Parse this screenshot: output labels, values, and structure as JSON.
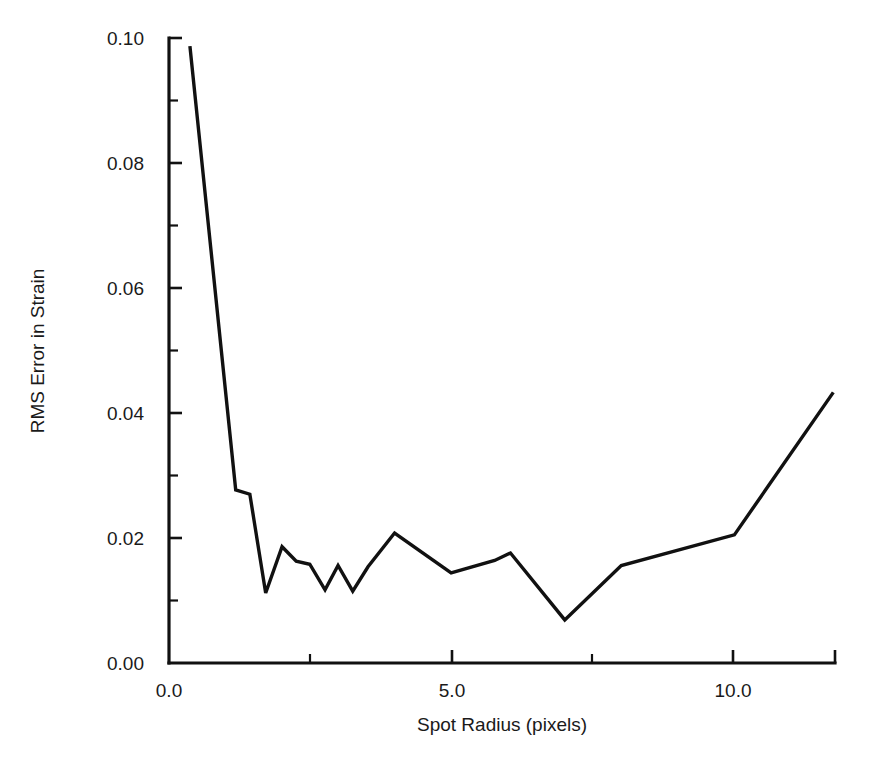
{
  "chart_data": {
    "type": "line",
    "title": "",
    "xlabel": "Spot Radius (pixels)",
    "ylabel": "RMS Error in Strain",
    "xlim": [
      0.0,
      11.78
    ],
    "ylim": [
      0.0,
      0.1
    ],
    "grid": false,
    "legend": null,
    "x_ticks": [
      0.0,
      2.5,
      5.0,
      7.5,
      10.0
    ],
    "x_tick_labels": [
      "0.0",
      "",
      "5.0",
      "",
      "10.0"
    ],
    "x_major_labeled": [
      "0.0",
      "5.0",
      "10.0"
    ],
    "y_ticks": [
      0.0,
      0.01,
      0.02,
      0.03,
      0.04,
      0.05,
      0.06,
      0.07,
      0.08,
      0.09,
      0.1
    ],
    "y_tick_labels": [
      "0.00",
      "",
      "0.02",
      "",
      "0.04",
      "",
      "0.06",
      "",
      "0.08",
      "",
      "0.10"
    ],
    "y_major_labeled": [
      "0.00",
      "0.02",
      "0.04",
      "0.06",
      "0.08",
      "0.10"
    ],
    "series": [
      {
        "name": "RMS Error in Strain",
        "color": "#111111",
        "x": [
          0.37,
          1.18,
          1.43,
          1.71,
          2.0,
          2.25,
          2.49,
          2.76,
          2.99,
          3.25,
          3.52,
          3.99,
          4.99,
          5.76,
          6.04,
          7.0,
          8.0,
          10.0,
          11.75
        ],
        "y": [
          0.0987,
          0.0277,
          0.027,
          0.0112,
          0.0186,
          0.0163,
          0.0158,
          0.0117,
          0.0156,
          0.0115,
          0.0154,
          0.0208,
          0.0144,
          0.0164,
          0.0176,
          0.0069,
          0.0156,
          0.0205,
          0.0433
        ]
      }
    ]
  },
  "axes": {
    "x_axis_name": "Spot Radius (pixels)",
    "y_axis_name": "RMS Error in Strain"
  },
  "labels": {
    "y0": "0.00",
    "y1": "0.02",
    "y2": "0.04",
    "y3": "0.06",
    "y4": "0.08",
    "y5": "0.10",
    "x0": "0.0",
    "x1": "5.0",
    "x2": "10.0"
  }
}
